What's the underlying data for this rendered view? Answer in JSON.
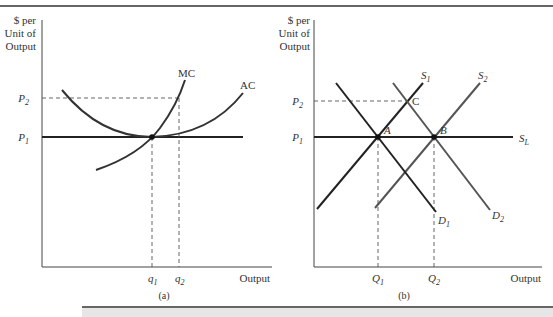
{
  "panels": [
    {
      "id": "a",
      "caption": "(a)",
      "y_axis_label": [
        "$ per",
        "Unit of",
        "Output"
      ],
      "x_axis_label": "Output",
      "price_labels": {
        "p2": "P",
        "p2_sub": "2",
        "p1": "P",
        "p1_sub": "1"
      },
      "quantity_labels": [
        {
          "base": "q",
          "sub": "1"
        },
        {
          "base": "q",
          "sub": "2"
        }
      ],
      "curves": {
        "mc": "MC",
        "ac": "AC"
      }
    },
    {
      "id": "b",
      "caption": "(b)",
      "y_axis_label": [
        "$ per",
        "Unit of",
        "Output"
      ],
      "x_axis_label": "Output",
      "price_labels": {
        "p2": "P",
        "p2_sub": "2",
        "p1": "P",
        "p1_sub": "1"
      },
      "quantity_labels": [
        {
          "base": "Q",
          "sub": "1"
        },
        {
          "base": "Q",
          "sub": "2"
        }
      ],
      "curves": {
        "s1": {
          "base": "S",
          "sub": "1"
        },
        "s2": {
          "base": "S",
          "sub": "2"
        },
        "sl": {
          "base": "S",
          "sub": "L"
        },
        "d1": {
          "base": "D",
          "sub": "1"
        },
        "d2": {
          "base": "D",
          "sub": "2"
        }
      },
      "points": {
        "a": "A",
        "b": "B",
        "c": "C"
      }
    }
  ],
  "colors": {
    "line": "#222222",
    "dashed": "#555555",
    "text": "#333333"
  }
}
